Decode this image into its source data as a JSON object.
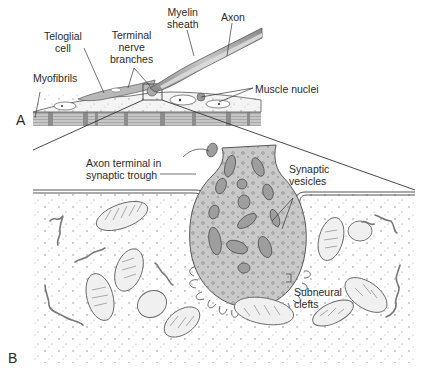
{
  "figure": {
    "panels": [
      {
        "id": "A",
        "letter": "A",
        "labels": {
          "teloglial_cell": [
            "Teloglial",
            "cell"
          ],
          "terminal_nerve_branches": [
            "Terminal",
            "nerve",
            "branches"
          ],
          "myelin_sheath": [
            "Myelin",
            "sheath"
          ],
          "axon": "Axon",
          "myofibrils": "Myofibrils",
          "muscle_nuclei": "Muscle nuclei"
        }
      },
      {
        "id": "B",
        "letter": "B",
        "labels": {
          "axon_terminal": [
            "Axon terminal in",
            "synaptic trough"
          ],
          "synaptic_vesicles": [
            "Synaptic",
            "vesicles"
          ],
          "subneural_clefts": [
            "Subneural",
            "clefts"
          ]
        }
      }
    ],
    "colors": {
      "outline": "#4a4a4a",
      "fill_light": "#e6e6e6",
      "fill_mid": "#bdbdbd",
      "fill_dark": "#8a8a8a",
      "text": "#2a2a2a"
    }
  }
}
